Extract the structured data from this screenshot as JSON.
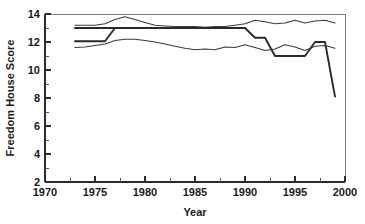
{
  "chart_data": {
    "type": "line",
    "title": "",
    "xlabel": "Year",
    "ylabel": "Freedom House Score",
    "xlim": [
      1970,
      2000
    ],
    "ylim": [
      2,
      14
    ],
    "xticks": [
      1970,
      1975,
      1980,
      1985,
      1990,
      1995,
      2000
    ],
    "xtick_labels": [
      "1970",
      "1975",
      "1980",
      "1985",
      "1990",
      "1995",
      "2000"
    ],
    "xminor_step": 2.5,
    "yticks": [
      2,
      4,
      6,
      8,
      10,
      12,
      14
    ],
    "ytick_labels": [
      "2",
      "4",
      "6",
      "8",
      "10",
      "12",
      "14"
    ],
    "yminor": [
      3,
      5,
      7,
      9,
      11,
      13
    ],
    "grid": false,
    "legend": "none",
    "frame": "box",
    "series": [
      {
        "name": "upper-thin-band",
        "style": "thin",
        "x": [
          1973,
          1974,
          1975,
          1976,
          1977,
          1978,
          1979,
          1980,
          1981,
          1982,
          1983,
          1984,
          1985,
          1986,
          1987,
          1988,
          1989,
          1990,
          1991,
          1992,
          1993,
          1994,
          1995,
          1996,
          1997,
          1998,
          1999
        ],
        "values": [
          13.2,
          13.2,
          13.2,
          13.3,
          13.6,
          13.8,
          13.6,
          13.4,
          13.2,
          13.15,
          13.1,
          13.1,
          13.1,
          13.05,
          13.1,
          13.1,
          13.2,
          13.3,
          13.55,
          13.45,
          13.3,
          13.35,
          13.55,
          13.35,
          13.5,
          13.55,
          13.35
        ]
      },
      {
        "name": "upper-thick-median",
        "style": "thick",
        "x": [
          1973,
          1974,
          1975,
          1976,
          1977,
          1978,
          1979,
          1980,
          1981,
          1982,
          1983,
          1984,
          1985,
          1986,
          1987,
          1988,
          1989,
          1990,
          1991,
          1992,
          1993,
          1994,
          1995,
          1996,
          1997,
          1998,
          1999
        ],
        "values": [
          13.0,
          13.0,
          13.0,
          13.0,
          13.0,
          13.0,
          13.0,
          13.0,
          13.0,
          13.0,
          13.0,
          13.0,
          13.0,
          13.0,
          13.0,
          13.0,
          13.0,
          13.0,
          12.3,
          12.3,
          11.0,
          11.0,
          11.0,
          11.0,
          12.0,
          12.0,
          8.1
        ]
      },
      {
        "name": "lower-thick-median",
        "style": "thick",
        "x": [
          1973,
          1974,
          1975,
          1976,
          1977,
          1978,
          1979,
          1980,
          1981,
          1982,
          1983,
          1984,
          1985,
          1986,
          1987,
          1988,
          1989,
          1990
        ],
        "values": [
          12.05,
          12.05,
          12.05,
          12.05,
          13.0,
          13.0,
          13.0,
          13.0,
          13.0,
          13.0,
          13.0,
          13.0,
          13.0,
          13.0,
          13.0,
          13.0,
          13.0,
          13.0
        ]
      },
      {
        "name": "lower-thin-band",
        "style": "thin",
        "x": [
          1973,
          1974,
          1975,
          1976,
          1977,
          1978,
          1979,
          1980,
          1981,
          1982,
          1983,
          1984,
          1985,
          1986,
          1987,
          1988,
          1989,
          1990,
          1991,
          1992,
          1993,
          1994,
          1995,
          1996,
          1997,
          1998,
          1999
        ],
        "values": [
          11.6,
          11.65,
          11.75,
          11.85,
          12.1,
          12.2,
          12.2,
          12.1,
          12.0,
          11.85,
          11.7,
          11.55,
          11.45,
          11.5,
          11.45,
          11.65,
          11.6,
          11.8,
          11.6,
          11.4,
          11.5,
          11.8,
          11.65,
          11.4,
          11.7,
          11.75,
          11.55
        ]
      }
    ]
  }
}
